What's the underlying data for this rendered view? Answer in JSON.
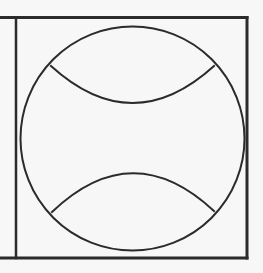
{
  "diagram": {
    "colors": {
      "background": "#f7f7f7",
      "stroke": "#2b2b2b"
    },
    "frame": {
      "top_line": {
        "x1": 0,
        "y1": 17.5,
        "x2": 247,
        "y2": 17.5
      },
      "bottom_line": {
        "x1": 0,
        "y1": 258,
        "x2": 247,
        "y2": 258
      },
      "left_divider": {
        "x1": 16,
        "y1": 17.5,
        "x2": 16,
        "y2": 258
      },
      "right_line": {
        "x1": 247,
        "y1": 17.5,
        "x2": 247,
        "y2": 258
      }
    },
    "ball": {
      "cx": 132.5,
      "cy": 138.5,
      "r": 112
    },
    "seams": {
      "upper": {
        "start": [
          51,
          66
        ],
        "control": [
          132.5,
          140
        ],
        "end": [
          214,
          66
        ]
      },
      "lower": {
        "start": [
          52,
          212
        ],
        "control": [
          132.5,
          135
        ],
        "end": [
          214,
          211
        ]
      }
    }
  }
}
